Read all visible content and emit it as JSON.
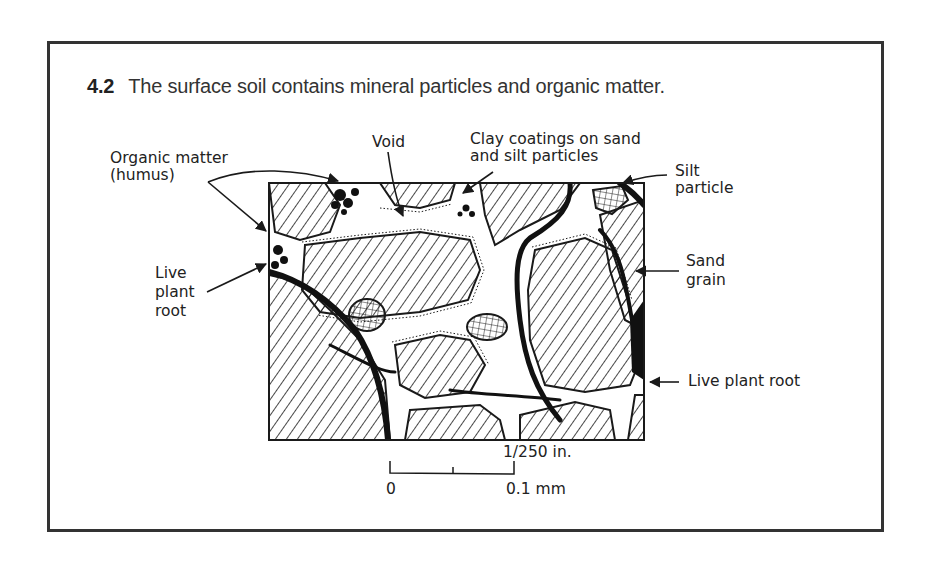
{
  "figure": {
    "number": "4.2",
    "caption": "The surface soil contains mineral particles and organic matter."
  },
  "labels": {
    "organic_matter_line1": "Organic matter",
    "organic_matter_line2": "(humus)",
    "void": "Void",
    "clay_line1": "Clay coatings on sand",
    "clay_line2": "and silt particles",
    "silt_line1": "Silt",
    "silt_line2": "particle",
    "live_root_left_line1": "Live",
    "live_root_left_line2": "plant",
    "live_root_left_line3": "root",
    "sand_line1": "Sand",
    "sand_line2": "grain",
    "live_root_right": "Live plant root"
  },
  "scale_bar": {
    "top_label": "1/250 in.",
    "left_label": "0",
    "right_label": "0.1 mm"
  },
  "colors": {
    "ink": "#1a1a1a",
    "frame": "#333333",
    "background": "#ffffff"
  }
}
